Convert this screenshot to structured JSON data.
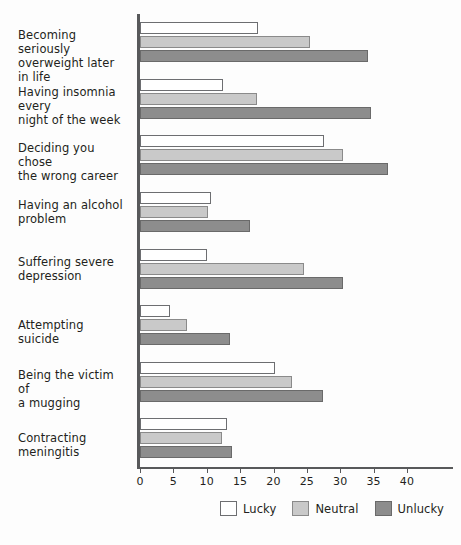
{
  "chart_data": {
    "type": "bar",
    "orientation": "horizontal",
    "title": "",
    "xlabel": "",
    "ylabel": "",
    "xlim": [
      0,
      40
    ],
    "xticks": [
      0,
      5,
      10,
      15,
      20,
      25,
      30,
      35,
      40
    ],
    "xtick_labels": [
      "0",
      "5",
      "10",
      "15",
      "20",
      "25",
      "30",
      "35",
      "40"
    ],
    "grid": false,
    "legend_position": "bottom",
    "categories": [
      "Becoming seriously overweight later in life",
      "Having insomnia every night of the week",
      "Deciding you chose the wrong career",
      "Having an alcohol problem",
      "Suffering severe depression",
      "Attempting suicide",
      "Being the victim of a mugging",
      "Contracting meningitis"
    ],
    "category_lines": [
      [
        "Becoming seriously",
        "overweight later in life"
      ],
      [
        "Having insomnia every",
        "night of the week"
      ],
      [
        "Deciding you chose",
        "the wrong career"
      ],
      [
        "Having an alcohol",
        "problem"
      ],
      [
        "Suffering severe",
        "depression"
      ],
      [
        "Attempting suicide"
      ],
      [
        "Being the victim of",
        "a mugging"
      ],
      [
        "Contracting meningitis"
      ]
    ],
    "series": [
      {
        "name": "Lucky",
        "color": "#ffffff",
        "values": [
          17.7,
          12.4,
          27.6,
          10.6,
          10.1,
          4.5,
          20.2,
          13.0
        ]
      },
      {
        "name": "Neutral",
        "color": "#c9c9c9",
        "values": [
          25.5,
          17.5,
          30.4,
          10.2,
          24.6,
          7.0,
          22.8,
          12.3
        ]
      },
      {
        "name": "Unlucky",
        "color": "#8d8d8d",
        "values": [
          34.2,
          34.6,
          37.2,
          16.5,
          30.4,
          13.5,
          27.4,
          13.8
        ]
      }
    ]
  },
  "legend": {
    "items": [
      {
        "label": "Lucky",
        "swatch": "lucky-swatch"
      },
      {
        "label": "Neutral",
        "swatch": "neutral-swatch"
      },
      {
        "label": "Unlucky",
        "swatch": "unlucky-swatch"
      }
    ]
  }
}
